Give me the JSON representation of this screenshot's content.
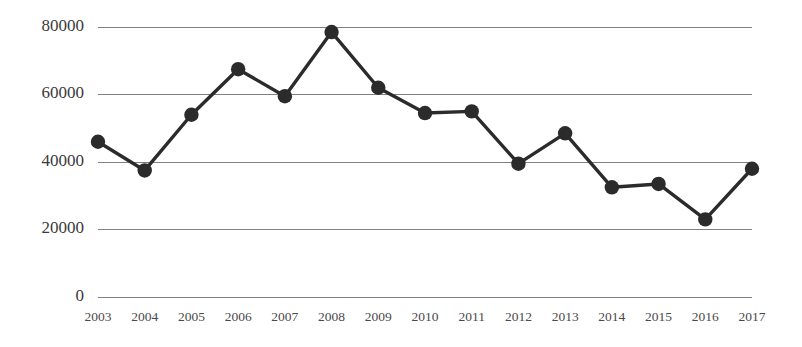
{
  "chart_data": {
    "type": "line",
    "title": "",
    "subtitle": "",
    "xlabel": "",
    "ylabel": "",
    "categories": [
      "2003",
      "2004",
      "2005",
      "2006",
      "2007",
      "2008",
      "2009",
      "2010",
      "2011",
      "2012",
      "2013",
      "2014",
      "2015",
      "2016",
      "2017"
    ],
    "values": [
      46000,
      37500,
      54000,
      67500,
      59500,
      78500,
      62000,
      54500,
      55000,
      39500,
      48500,
      32500,
      33500,
      23000,
      38000
    ],
    "series": [
      {
        "name": "",
        "values": [
          46000,
          37500,
          54000,
          67500,
          59500,
          78500,
          62000,
          54500,
          55000,
          39500,
          48500,
          32500,
          33500,
          23000,
          38000
        ],
        "color": "#2b2b2b",
        "marker": "circle"
      }
    ],
    "ylim": [
      0,
      80000
    ],
    "yticks": [
      0,
      20000,
      40000,
      60000,
      80000
    ],
    "ytick_labels": [
      "0",
      "20000",
      "40000",
      "60000",
      "80000"
    ],
    "xtick_labels": [
      "2003",
      "2004",
      "2005",
      "2006",
      "2007",
      "2008",
      "2009",
      "2010",
      "2011",
      "2012",
      "2013",
      "2014",
      "2015",
      "2016",
      "2017"
    ],
    "grid": true,
    "grid_axis": "y",
    "grid_color": "#808080",
    "legend": false,
    "legend_position": "none",
    "annotations": [],
    "line_color": "#2b2b2b",
    "marker_color": "#2b2b2b",
    "background_color": "#ffffff",
    "axis_label_color": "#3a3a3a"
  }
}
